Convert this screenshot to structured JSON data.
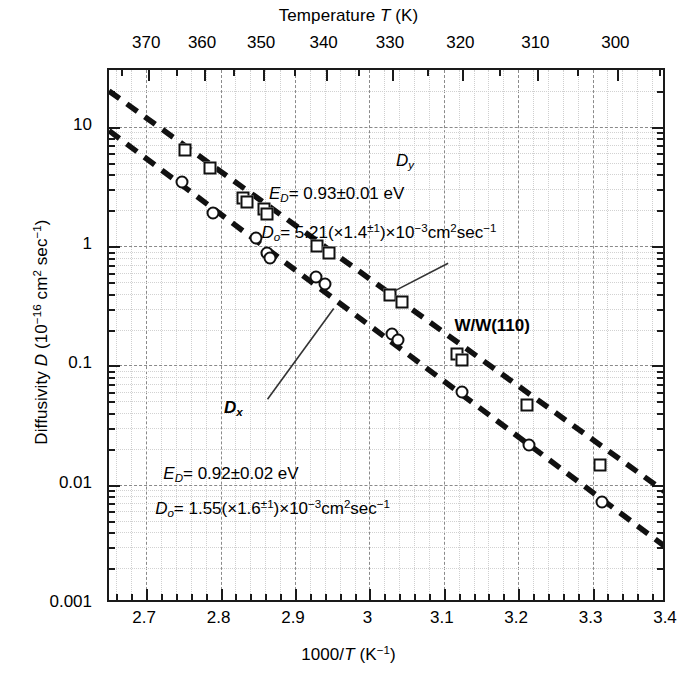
{
  "chart_data": {
    "type": "scatter",
    "title": "",
    "xlabel": "1000/T (K^-1)",
    "ylabel": "Diffusivity D (10^-16 cm^2 sec^-1)",
    "top_axis_label": "Temperature T (K)",
    "xlim": [
      2.65,
      3.4
    ],
    "ylim": [
      0.001,
      30
    ],
    "yscale": "log",
    "grid": true,
    "legend_position": "inline-annotations",
    "x_ticks": [
      2.7,
      2.8,
      2.9,
      3.0,
      3.1,
      3.2,
      3.3,
      3.4
    ],
    "x_tick_labels": [
      "2.7",
      "2.8",
      "2.9",
      "3",
      "3.1",
      "3.2",
      "3.3",
      "3.4"
    ],
    "top_ticks_T": [
      370,
      360,
      350,
      340,
      330,
      320,
      310,
      300
    ],
    "top_tick_labels": [
      "370",
      "360",
      "350",
      "340",
      "330",
      "320",
      "310",
      "300"
    ],
    "y_ticks": [
      10,
      1,
      0.1,
      0.01,
      0.001
    ],
    "y_tick_labels": [
      "10",
      "1",
      "0.1",
      "0.01",
      "0.001"
    ],
    "series": [
      {
        "name": "Dy",
        "marker": "square",
        "fit_label": "D_y",
        "activation_energy": "0.93",
        "activation_energy_error": "0.01",
        "prefactor": "5.21",
        "prefactor_factor": "1.4",
        "points": [
          {
            "x": 2.752,
            "y": 6.4
          },
          {
            "x": 2.786,
            "y": 4.5
          },
          {
            "x": 2.83,
            "y": 2.55
          },
          {
            "x": 2.835,
            "y": 2.35
          },
          {
            "x": 2.858,
            "y": 2.05
          },
          {
            "x": 2.862,
            "y": 1.85
          },
          {
            "x": 2.93,
            "y": 1.0
          },
          {
            "x": 2.946,
            "y": 0.88
          },
          {
            "x": 3.028,
            "y": 0.39
          },
          {
            "x": 3.044,
            "y": 0.34
          },
          {
            "x": 3.118,
            "y": 0.125
          },
          {
            "x": 3.124,
            "y": 0.112
          },
          {
            "x": 3.212,
            "y": 0.047
          },
          {
            "x": 3.31,
            "y": 0.0145
          }
        ]
      },
      {
        "name": "Dx",
        "marker": "circle",
        "fit_label": "D_x",
        "activation_energy": "0.92",
        "activation_energy_error": "0.02",
        "prefactor": "1.55",
        "prefactor_factor": "1.6",
        "points": [
          {
            "x": 2.748,
            "y": 3.45
          },
          {
            "x": 2.79,
            "y": 1.9
          },
          {
            "x": 2.848,
            "y": 1.18
          },
          {
            "x": 2.862,
            "y": 0.87
          },
          {
            "x": 2.866,
            "y": 0.8
          },
          {
            "x": 2.928,
            "y": 0.55
          },
          {
            "x": 2.94,
            "y": 0.48
          },
          {
            "x": 3.03,
            "y": 0.185
          },
          {
            "x": 3.038,
            "y": 0.165
          },
          {
            "x": 3.124,
            "y": 0.06
          },
          {
            "x": 3.214,
            "y": 0.0215
          },
          {
            "x": 3.312,
            "y": 0.0072
          }
        ]
      }
    ],
    "fit_lines": [
      {
        "name": "Dy-fit",
        "x1": 2.65,
        "y1": 20.0,
        "x2": 3.4,
        "y2": 0.0085
      },
      {
        "name": "Dx-fit",
        "x1": 2.65,
        "y1": 9.3,
        "x2": 3.4,
        "y2": 0.00295
      }
    ],
    "sample_label": "W/W(110)"
  },
  "axes": {
    "top_title_prefix": "Temperature ",
    "top_title_italic": "T",
    "top_title_suffix": " (K)",
    "bottom_title_prefix": "1000/",
    "bottom_title_italic": "T",
    "bottom_title_unit_open": " (K",
    "bottom_title_unit_sup": "−1",
    "bottom_title_unit_close": ")",
    "left_title_prefix": "Diffusivity ",
    "left_title_italic": "D",
    "left_title_open": " (10",
    "left_title_sup1": "−16",
    "left_title_mid": " cm",
    "left_title_sup2": "2",
    "left_title_sec": " sec",
    "left_title_sup3": "−1",
    "left_title_close": ")"
  },
  "annotations": {
    "dy_label_base": "D",
    "dy_label_sub": "y",
    "dx_label_base": "D",
    "dx_label_sub": "x",
    "dy_ed_sym": "E",
    "dy_ed_sub": "D",
    "dy_ed_value": "= 0.93±0.01 eV",
    "dy_do_sym": "D",
    "dy_do_sub": "o",
    "dy_do_value_a": "= 5.21(×1.4",
    "dy_do_sup": "±1",
    "dy_do_value_b": ")×10",
    "dy_do_sup2": "−3",
    "dy_do_value_c": "cm",
    "dy_do_sup3": "2",
    "dy_do_value_d": "sec",
    "dy_do_sup4": "−1",
    "dx_ed_sym": "E",
    "dx_ed_sub": "D",
    "dx_ed_value": "= 0.92±0.02 eV",
    "dx_do_sym": "D",
    "dx_do_sub": "o",
    "dx_do_value_a": "= 1.55(×1.6",
    "dx_do_sup": "±1",
    "dx_do_value_b": ")×10",
    "dx_do_sup2": "−3",
    "dx_do_value_c": "cm",
    "dx_do_sup3": "2",
    "dx_do_value_d": "sec",
    "dx_do_sup4": "−1",
    "sample": "W/W(110)"
  },
  "colors": {
    "axis": "#1a1a1a",
    "marker_edge": "#111111",
    "fit_line": "#111111",
    "grid_major": "#8a8a8a",
    "grid_minor": "#cfcfcf"
  }
}
